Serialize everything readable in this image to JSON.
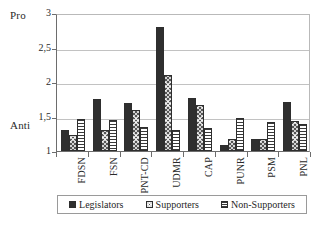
{
  "chart_data": {
    "type": "bar",
    "title": "",
    "xlabel": "",
    "ylabel": "",
    "ylim": [
      1,
      3
    ],
    "ytick_labels": [
      "1",
      "1,5",
      "2",
      "2,5",
      "3"
    ],
    "ytick_values": [
      1,
      1.5,
      2,
      2.5,
      3
    ],
    "grid": true,
    "legend_position": "bottom",
    "axis_annotations": {
      "top": "Pro",
      "bottom": "Anti"
    },
    "categories": [
      "FDSN",
      "FSN",
      "PNT-CD",
      "UDMR",
      "CAP",
      "PUNR",
      "PSM",
      "PNL"
    ],
    "series": [
      {
        "name": "Legislators",
        "pattern": "solid",
        "color": "#2f2f2f",
        "values": [
          1.31,
          1.75,
          1.7,
          2.8,
          1.77,
          1.08,
          1.17,
          1.71
        ]
      },
      {
        "name": "Supporters",
        "pattern": "crosshatch",
        "color": "#555555",
        "values": [
          1.23,
          1.3,
          1.6,
          2.1,
          1.67,
          1.17,
          1.17,
          1.43
        ]
      },
      {
        "name": "Non-Supporters",
        "pattern": "horizontal-lines",
        "color": "#ffffff",
        "values": [
          1.46,
          1.45,
          1.35,
          1.31,
          1.33,
          1.48,
          1.42,
          1.39
        ]
      }
    ]
  },
  "legend": {
    "items": [
      {
        "label": "Legislators"
      },
      {
        "label": "Supporters"
      },
      {
        "label": "Non-Supporters"
      }
    ]
  }
}
